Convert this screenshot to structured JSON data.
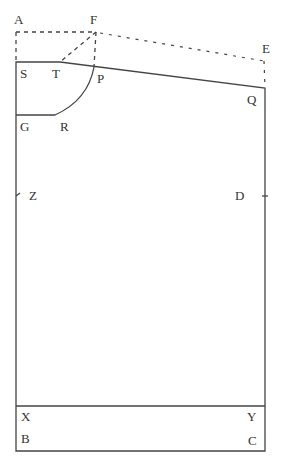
{
  "diagram": {
    "type": "pattern-draft",
    "colors": {
      "line": "#444444",
      "text": "#333333",
      "background": "#ffffff"
    },
    "labels": {
      "A": "A",
      "F": "F",
      "E": "E",
      "S": "S",
      "T": "T",
      "P": "P",
      "Q": "Q",
      "G": "G",
      "R": "R",
      "Z": "Z",
      "D": "D",
      "X": "X",
      "Y": "Y",
      "B": "B",
      "C": "C"
    }
  }
}
